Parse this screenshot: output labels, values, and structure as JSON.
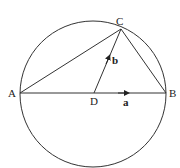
{
  "diagram": {
    "circle": {
      "cx": 93,
      "cy": 94,
      "r": 73
    },
    "points": {
      "A": {
        "label": "A",
        "x": 20,
        "y": 93
      },
      "B": {
        "label": "B",
        "x": 166,
        "y": 93
      },
      "C": {
        "label": "C",
        "x": 121,
        "y": 29
      },
      "D": {
        "label": "D",
        "x": 94,
        "y": 93
      }
    },
    "vectors": {
      "a": {
        "label": "a"
      },
      "b": {
        "label": "b"
      }
    }
  }
}
